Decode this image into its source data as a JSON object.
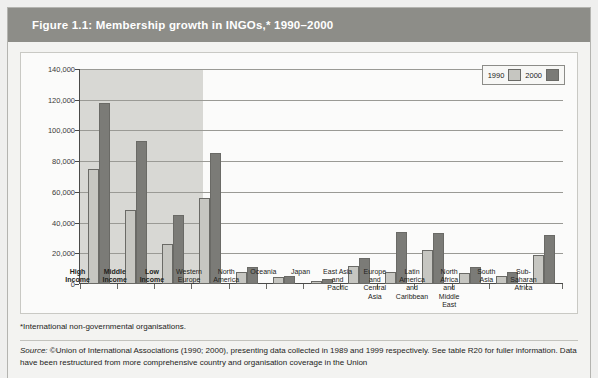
{
  "figure": {
    "title": "Figure 1.1: Membership growth in INGOs,* 1990–2000",
    "footnote": "*International non-governmental organisations.",
    "source_prefix": "Source:",
    "source_text": " ©Union of International Associations (1990; 2000), presenting data collected in 1989 and 1999 respectively. See table R20 for fuller information. Data have been restructured from more comprehensive country and organisation coverage in the Union"
  },
  "colors": {
    "title_bar": "#8d8d88",
    "series_1990": "#c6c6c1",
    "series_2000": "#7b7b77",
    "shaded_band": "#d8d8d4",
    "panel_background": "#fbfbfa"
  },
  "legend": {
    "position": "top-right",
    "entries": [
      {
        "label": "1990",
        "color": "#c6c6c1"
      },
      {
        "label": "2000",
        "color": "#7b7b77"
      }
    ]
  },
  "chart_data": {
    "type": "bar",
    "title": "Figure 1.1: Membership growth in INGOs,* 1990–2000",
    "xlabel": "",
    "ylabel": "",
    "ylim": [
      0,
      140000
    ],
    "yticks": [
      0,
      20000,
      40000,
      60000,
      80000,
      100000,
      120000,
      140000
    ],
    "ytick_labels": [
      "0",
      "20,000",
      "40,000",
      "60,000",
      "80,000",
      "100,000",
      "120,000",
      "140,000"
    ],
    "grid": true,
    "legend_position": "top-right",
    "categories": [
      "High Income",
      "Middle Income",
      "Low Income",
      "Western Europe",
      "North America",
      "Oceania",
      "Japan",
      "East Asia and Pacific",
      "Europe and Central Asia",
      "Latin America and Caribbean",
      "North Africa and Middle East",
      "South Asia",
      "Sub-Saharan Africa"
    ],
    "category_lines": [
      [
        "High",
        "Income"
      ],
      [
        "Middle",
        "Income"
      ],
      [
        "Low",
        "Income"
      ],
      [
        "Western",
        "Europe"
      ],
      [
        "North",
        "America"
      ],
      [
        "Oceania"
      ],
      [
        "Japan"
      ],
      [
        "East Asia",
        "and",
        "Pacific"
      ],
      [
        "Europe",
        "and",
        "Central",
        "Asia"
      ],
      [
        "Latin",
        "America",
        "and",
        "Caribbean"
      ],
      [
        "North",
        "Africa",
        "and",
        "Middle",
        "East"
      ],
      [
        "South",
        "Asia"
      ],
      [
        "Sub-",
        "Saharan",
        "Africa"
      ]
    ],
    "category_bold": [
      true,
      true,
      true,
      false,
      false,
      false,
      false,
      false,
      false,
      false,
      false,
      false,
      false
    ],
    "shaded_categories": [
      "High Income",
      "Middle Income",
      "Low Income"
    ],
    "series": [
      {
        "name": "1990",
        "color": "#c6c6c1",
        "values": [
          75000,
          48000,
          26000,
          56000,
          8000,
          4500,
          2000,
          12000,
          8000,
          22000,
          7000,
          5000,
          19000
        ]
      },
      {
        "name": "2000",
        "color": "#7b7b77",
        "values": [
          118000,
          93000,
          45000,
          85000,
          11000,
          5500,
          3500,
          17000,
          34000,
          33000,
          11000,
          8000,
          32000
        ]
      }
    ]
  }
}
